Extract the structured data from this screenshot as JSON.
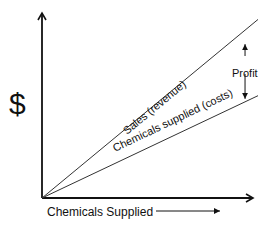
{
  "chart_data": {
    "type": "line",
    "title": "",
    "xlabel": "Chemicals Supplied",
    "ylabel": "$",
    "xlim": [
      0,
      1
    ],
    "ylim": [
      0,
      1
    ],
    "grid": false,
    "series": [
      {
        "name": "Sales (revenue)",
        "x": [
          0,
          1
        ],
        "y": [
          0,
          0.96
        ]
      },
      {
        "name": "Chemicals supplied (costs)",
        "x": [
          0,
          1
        ],
        "y": [
          0,
          0.55
        ]
      }
    ],
    "annotations": [
      {
        "text": "Profit",
        "kind": "double-arrow",
        "between": [
          "Sales (revenue)",
          "Chemicals supplied (costs)"
        ],
        "at_x": 0.94
      }
    ]
  },
  "labels": {
    "y_axis": "$",
    "x_axis": "Chemicals Supplied",
    "sales": "Sales (revenue)",
    "costs": "Chemicals supplied (costs)",
    "profit": "Profit"
  }
}
